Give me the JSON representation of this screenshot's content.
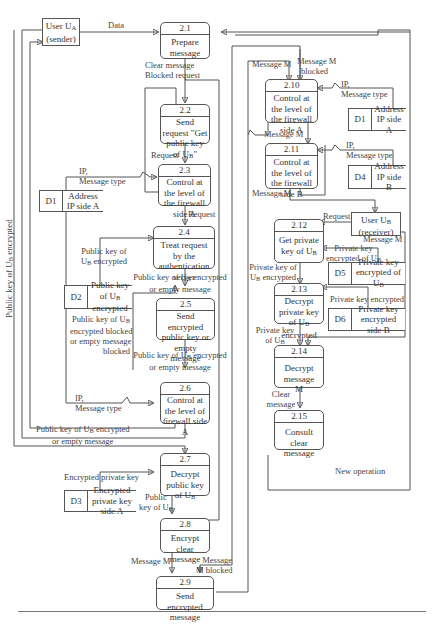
{
  "externals": {
    "user_a": {
      "line1": "User U",
      "sub": "A",
      "line2": "(sender)"
    },
    "user_b": {
      "line1": "User U",
      "sub": "B",
      "line2": "(receiver)"
    }
  },
  "processes": {
    "p2_1": {
      "num": "2.1",
      "text": "Prepare message"
    },
    "p2_2": {
      "num": "2.2",
      "text": "Send request \"Get public key of U",
      "sub": "B",
      "tail": "\""
    },
    "p2_3": {
      "num": "2.3",
      "text": "Control at the level of the firewall side A"
    },
    "p2_4": {
      "num": "2.4",
      "text": "Treat request by the authentication server"
    },
    "p2_5": {
      "num": "2.5",
      "text": "Send encrypted public key or empty message"
    },
    "p2_6": {
      "num": "2.6",
      "text": "Control at the level of firewall side A"
    },
    "p2_7": {
      "num": "2.7",
      "text": "Decrypt public key of U",
      "sub": "B"
    },
    "p2_8": {
      "num": "2.8",
      "text": "Encrypt clear message"
    },
    "p2_9": {
      "num": "2.9",
      "text": "Send encrypted message"
    },
    "p2_10": {
      "num": "2.10",
      "text": "Control at the level of the firewall side A"
    },
    "p2_11": {
      "num": "2.11",
      "text": "Control at the level of the firewall side B"
    },
    "p2_12": {
      "num": "2.12",
      "text": "Get private key of U",
      "sub": "B"
    },
    "p2_13": {
      "num": "2.13",
      "text": "Decrypt private key of U",
      "sub": "B",
      "tail": " encrypted"
    },
    "p2_14": {
      "num": "2.14",
      "text": "Decrypt message M"
    },
    "p2_15": {
      "num": "2.15",
      "text": "Consult clear message"
    }
  },
  "stores": {
    "d1_left": {
      "id": "D1",
      "name": "Address IP side A"
    },
    "d2": {
      "id": "D2",
      "name": "Public key of U",
      "sub": "B",
      "tail": " encrypted"
    },
    "d3": {
      "id": "D3",
      "name": "Encrypted private key side A"
    },
    "d1_right": {
      "id": "D1",
      "name": "Address IP side A"
    },
    "d4": {
      "id": "D4",
      "name": "Address IP side B"
    },
    "d5": {
      "id": "D5",
      "name": "Private key encrypted of U",
      "sub": "B"
    },
    "d6": {
      "id": "D6",
      "name": "Private key encrypted side B"
    }
  },
  "flows": {
    "data": "Data",
    "clear_message": "Clear message",
    "blocked_request": "Blocked request",
    "request_1": "Request",
    "ip_message_type_1a": "IP,",
    "ip_message_type_1b": "Message type",
    "request_2": "Request",
    "pk_encrypted_d2_in_a": "Public key of",
    "pk_encrypted_d2_in_b": "U",
    "pk_encrypted_d2_in_c": " encrypted",
    "pk_or_empty_1a": "Public key of U",
    "pk_or_empty_1b": " encrypted",
    "pk_or_empty_1c": "or empty message",
    "pk_blocked_a": "Public key of U",
    "pk_blocked_b": "encrypted blocked",
    "pk_blocked_c": "or empty message",
    "pk_blocked_d": "blocked",
    "pk_or_empty_2a": "Public key of U",
    "pk_or_empty_2b": " encrypted",
    "pk_or_empty_2c": "or empty message",
    "ip_message_type_2a": "IP,",
    "ip_message_type_2b": "Message type",
    "pk_or_empty_3a": "Public key of U",
    "pk_or_empty_3b": " encrypted",
    "pk_or_empty_3c": "or empty message",
    "encrypted_private_key": "Encrypted private key",
    "public_key_ub_a": "Public",
    "public_key_ub_b": "key of U",
    "message_m_1": "Message M",
    "message_m_blocked_1a": "Message",
    "message_m_blocked_1b": "M blocked",
    "message_m_2": "Message M",
    "message_m_blocked_2a": "Message M",
    "message_m_blocked_2b": "blocked",
    "ip_message_type_3a": "IP,",
    "ip_message_type_3b": "Message type",
    "message_m_3": "Message M",
    "ip_message_type_4a": "IP,",
    "ip_message_type_4b": "Message type",
    "message_m_4": "Message M",
    "request_3": "Request",
    "message_m_5": "Message M",
    "private_key_encrypted_of_ub_a": "Private key",
    "private_key_encrypted_of_ub_b": "encrypted of U",
    "private_key_ub_encrypted_a": "Private key of",
    "private_key_ub_encrypted_b": "U",
    "private_key_ub_encrypted_c": " encrypted",
    "private_key_encrypted": "Private key encrypted",
    "private_key_ub_a": "Private key",
    "private_key_ub_b": "of U",
    "clear_message_2a": "Clear",
    "clear_message_2b": "message",
    "new_operation": "New operation",
    "side_label": "Public key of U",
    "side_label_sub": "B",
    "side_label_tail": " encrypted",
    "sub_b": "B"
  }
}
